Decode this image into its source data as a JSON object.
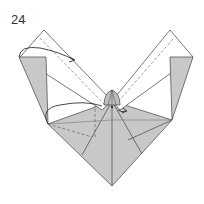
{
  "step": {
    "number": "24"
  },
  "diagram": {
    "type": "origami-fold-diagram",
    "shape": "heart-like base with two diagonal strips",
    "colors": {
      "paper_front": "#ffffff",
      "paper_back": "#c8c8c8",
      "line": "#555555",
      "arrow": "#333333"
    },
    "annotations": [
      {
        "kind": "arrow",
        "description": "curved arrow from left flap to left strip"
      },
      {
        "kind": "arrow",
        "description": "curved arrow from lower left across to center"
      },
      {
        "kind": "crease",
        "style": "valley-fold dashed lines"
      },
      {
        "kind": "detail",
        "description": "gathered fan at center"
      }
    ]
  }
}
